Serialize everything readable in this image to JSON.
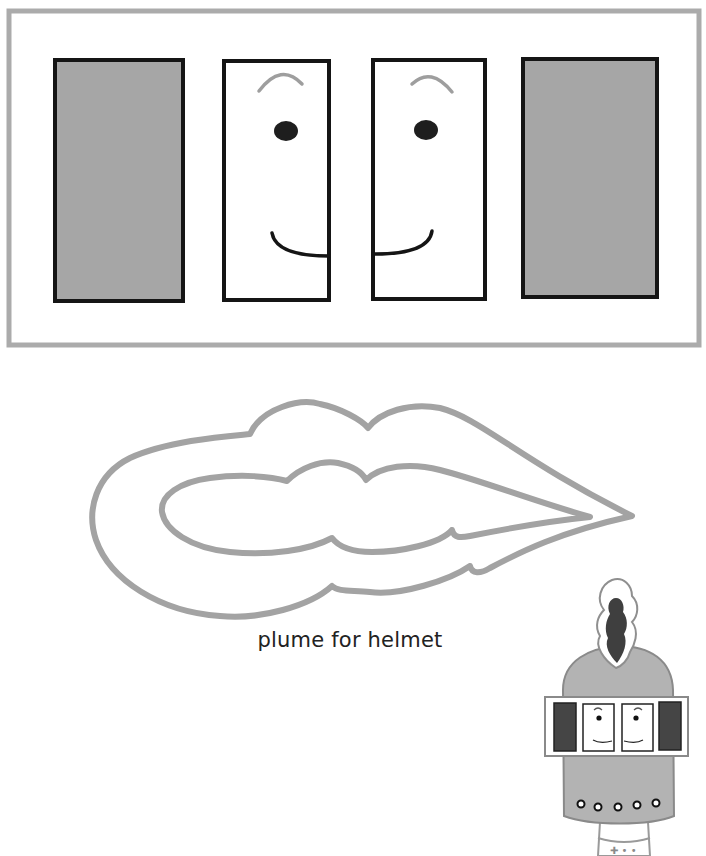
{
  "page": {
    "caption": "plume for helmet"
  },
  "visor_template": {
    "panels": [
      {
        "name": "left-dark-panel",
        "fill": "#a6a6a6"
      },
      {
        "name": "left-eye-panel",
        "fill": "#ffffff",
        "face": "facing-right"
      },
      {
        "name": "right-eye-panel",
        "fill": "#ffffff",
        "face": "facing-left"
      },
      {
        "name": "right-dark-panel",
        "fill": "#a6a6a6"
      }
    ]
  },
  "plume_template": {
    "label": "plume for helmet"
  },
  "helmet_preview": {
    "rivet_count": 5
  },
  "colors": {
    "frame_gray": "#ababab",
    "panel_gray": "#a6a6a6",
    "outline_black": "#151515",
    "eyebrow_gray": "#9e9e9e",
    "plume_gray": "#a3a3a3",
    "helmet_gray": "#b3b3b3",
    "plume_dark": "#3f3f3f",
    "visor_dark": "#454545"
  }
}
